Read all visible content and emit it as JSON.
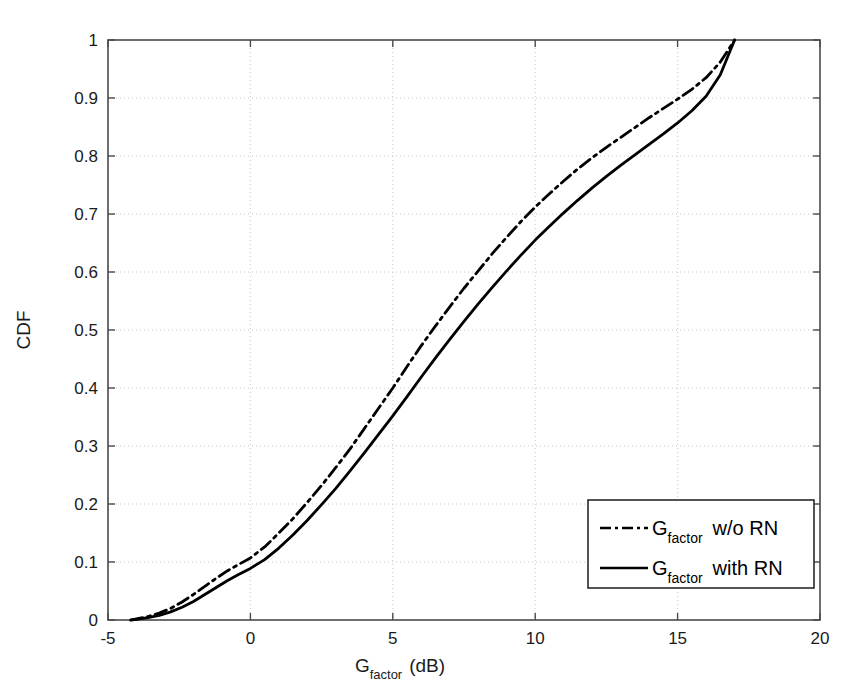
{
  "chart_data": {
    "type": "line",
    "title": "",
    "xlabel": "G_factor (dB)",
    "xlabel_main": "G",
    "xlabel_sub": "factor",
    "xlabel_unit": "(dB)",
    "ylabel": "CDF",
    "xlim": [
      -5,
      20
    ],
    "ylim": [
      0,
      1
    ],
    "grid": true,
    "grid_style": "dotted",
    "legend_position": "lower right",
    "xticks": [
      -5,
      0,
      5,
      10,
      15,
      20
    ],
    "xtick_labels": [
      "-5",
      "0",
      "5",
      "10",
      "15",
      "20"
    ],
    "yticks": [
      0,
      0.1,
      0.2,
      0.3,
      0.4,
      0.5,
      0.6,
      0.7,
      0.8,
      0.9,
      1
    ],
    "ytick_labels": [
      "0",
      "0.1",
      "0.2",
      "0.3",
      "0.4",
      "0.5",
      "0.6",
      "0.7",
      "0.8",
      "0.9",
      "1"
    ],
    "series": [
      {
        "name": "G_factor w/o RN",
        "name_main": "G",
        "name_sub": "factor",
        "name_tail": "w/o RN",
        "style": "dash-dot",
        "color": "#000000",
        "x": [
          -4.2,
          -4.0,
          -3.6,
          -3.2,
          -2.8,
          -2.4,
          -2.0,
          -1.6,
          -1.2,
          -0.8,
          -0.4,
          0.0,
          0.5,
          1.0,
          1.5,
          2.0,
          2.5,
          3.0,
          3.5,
          4.0,
          4.5,
          5.0,
          5.5,
          6.0,
          6.5,
          7.0,
          7.5,
          8.0,
          8.5,
          9.0,
          9.5,
          10.0,
          10.5,
          11.0,
          11.5,
          12.0,
          12.5,
          13.0,
          13.5,
          14.0,
          14.5,
          15.0,
          15.5,
          16.0,
          16.5,
          17.0
        ],
        "y": [
          0.0,
          0.002,
          0.006,
          0.012,
          0.02,
          0.031,
          0.044,
          0.058,
          0.072,
          0.085,
          0.096,
          0.107,
          0.126,
          0.15,
          0.175,
          0.203,
          0.232,
          0.263,
          0.295,
          0.33,
          0.365,
          0.4,
          0.437,
          0.473,
          0.507,
          0.54,
          0.572,
          0.602,
          0.632,
          0.66,
          0.687,
          0.712,
          0.735,
          0.757,
          0.778,
          0.797,
          0.815,
          0.832,
          0.849,
          0.866,
          0.882,
          0.898,
          0.915,
          0.935,
          0.962,
          1.0
        ]
      },
      {
        "name": "G_factor with RN",
        "name_main": "G",
        "name_sub": "factor",
        "name_tail": "with RN",
        "style": "solid",
        "color": "#000000",
        "x": [
          -4.2,
          -4.0,
          -3.6,
          -3.2,
          -2.8,
          -2.4,
          -2.0,
          -1.6,
          -1.2,
          -0.8,
          -0.4,
          0.0,
          0.5,
          1.0,
          1.5,
          2.0,
          2.5,
          3.0,
          3.5,
          4.0,
          4.5,
          5.0,
          5.5,
          6.0,
          6.5,
          7.0,
          7.5,
          8.0,
          8.5,
          9.0,
          9.5,
          10.0,
          10.5,
          11.0,
          11.5,
          12.0,
          12.5,
          13.0,
          13.5,
          14.0,
          14.5,
          15.0,
          15.5,
          16.0,
          16.5,
          17.0
        ],
        "y": [
          0.0,
          0.001,
          0.004,
          0.008,
          0.014,
          0.022,
          0.032,
          0.044,
          0.056,
          0.068,
          0.079,
          0.089,
          0.104,
          0.124,
          0.147,
          0.172,
          0.199,
          0.227,
          0.257,
          0.288,
          0.32,
          0.352,
          0.385,
          0.419,
          0.452,
          0.484,
          0.515,
          0.545,
          0.574,
          0.602,
          0.629,
          0.655,
          0.679,
          0.702,
          0.724,
          0.745,
          0.765,
          0.784,
          0.802,
          0.82,
          0.838,
          0.857,
          0.878,
          0.903,
          0.94,
          1.0
        ]
      }
    ]
  },
  "axes": {
    "xlabel_main": "G",
    "xlabel_sub": "factor",
    "xlabel_unit": "(dB)",
    "ylabel": "CDF"
  },
  "legend": {
    "entries": [
      {
        "main": "G",
        "sub": "factor",
        "tail": "w/o RN",
        "style": "dash-dot"
      },
      {
        "main": "G",
        "sub": "factor",
        "tail": "with RN",
        "style": "solid"
      }
    ]
  },
  "colors": {
    "line": "#000000",
    "axis": "#3a3a3a",
    "grid": "#c8c8c8",
    "background": "#ffffff"
  }
}
